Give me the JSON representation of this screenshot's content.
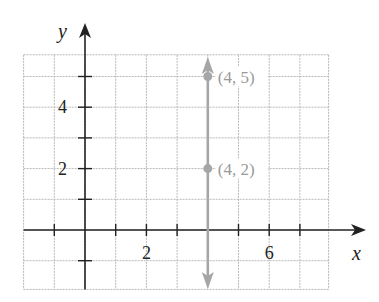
{
  "chart_data": {
    "type": "line",
    "title": "",
    "xlabel": "x",
    "ylabel": "y",
    "xlim": [
      -2,
      8
    ],
    "ylim": [
      -2,
      6
    ],
    "grid": true,
    "x_tick_labels": [
      "2",
      "6"
    ],
    "y_tick_labels": [
      "2",
      "4"
    ],
    "x_tick_values": [
      -1,
      1,
      2,
      3,
      5,
      6,
      7
    ],
    "y_tick_values": [
      -1,
      1,
      2,
      3,
      4,
      5
    ],
    "series": [
      {
        "name": "x = 4",
        "kind": "vertical-line",
        "x": [
          4,
          4
        ],
        "y": [
          -2,
          6
        ],
        "color": "#a6a6a6",
        "arrows": "both"
      }
    ],
    "points": [
      {
        "x": 4,
        "y": 5,
        "label": "(4, 5)"
      },
      {
        "x": 4,
        "y": 2,
        "label": "(4, 2)"
      }
    ]
  },
  "colors": {
    "axis": "#222222",
    "grid": "#b8b8b8",
    "highlight": "#a6a6a6",
    "point_label": "#9a9a9a"
  }
}
